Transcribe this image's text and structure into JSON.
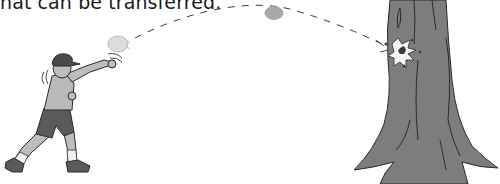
{
  "caption": {
    "text": "hat can be transferred."
  },
  "illustration": {
    "subjects": [
      "boy-throwing-ball",
      "ball-trajectory",
      "tree-trunk-with-splat"
    ],
    "colors": {
      "tree": "#7d7d7d",
      "outline": "#2b2b2b",
      "ball": "#a9a9a9",
      "ball_light": "#d9d9d9",
      "shirt": "#b9b9b9",
      "shorts": "#5a5a5a",
      "skin": "#bdbdbd",
      "cap": "#4a4a4a",
      "sock": "#f0f0f0"
    }
  }
}
